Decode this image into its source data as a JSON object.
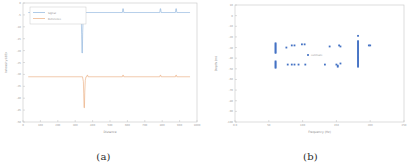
{
  "figure": {
    "panels": [
      {
        "id": "panel-a",
        "caption": "(a)",
        "chart_data": {
          "type": "line",
          "title": "",
          "xlabel": "Distance",
          "ylabel": "Intensity (dB)",
          "xlim": [
            0,
            1000
          ],
          "ylim": [
            -50,
            0
          ],
          "xticks": [
            0,
            100,
            200,
            300,
            400,
            500,
            600,
            700,
            800,
            900,
            1000
          ],
          "xticklabels": [
            "0",
            "100",
            "200",
            "300",
            "400",
            "500",
            "600",
            "700",
            "800",
            "900",
            "1000"
          ],
          "yticks": [
            -50,
            -45,
            -40,
            -35,
            -30,
            -25,
            -20,
            -15,
            -10,
            -5,
            0
          ],
          "yticklabels": [
            "-50",
            "-45",
            "-40",
            "-35",
            "-30",
            "-25",
            "-20",
            "-15",
            "-10",
            "-5",
            "0"
          ],
          "grid": false,
          "legend_position": "upper left",
          "series": [
            {
              "name": "Signal",
              "color": "#7ba7d7",
              "baseline": -4.0,
              "notch_x": 340,
              "notch_depth": -21.0,
              "spike_x": [
                575,
                790,
                880
              ],
              "spike_height": 1.6
            },
            {
              "name": "Reference",
              "color": "#e8a06a",
              "baseline": -31.0,
              "notch_x": 352,
              "notch_depth": -44.0,
              "spike_x": [
                370,
                575,
                790,
                880
              ],
              "spike_height": 0.7
            }
          ]
        }
      },
      {
        "id": "panel-b",
        "caption": "(b)",
        "chart_data": {
          "type": "scatter",
          "title": "",
          "xlabel": "Frequency (Hz)",
          "ylabel": "Depth (m)",
          "xlim": [
            0,
            250
          ],
          "ylim": [
            -100,
            10
          ],
          "xticks": [
            0,
            50,
            100,
            150,
            200,
            250
          ],
          "xticklabels": [
            "0.0",
            "50",
            "100",
            "150",
            "200",
            "250"
          ],
          "yticks": [
            -100,
            -90,
            -80,
            -70,
            -60,
            -50,
            -40,
            -30,
            -20,
            -10,
            0,
            10
          ],
          "yticklabels": [
            "-100",
            "-90",
            "-80",
            "-70",
            "-60",
            "-50",
            "-40",
            "-30",
            "-20",
            "-10",
            "0",
            "10"
          ],
          "grid": false,
          "marker": "square",
          "marker_color": "#4472c4",
          "annotation": "estimate",
          "annotation_x": 108,
          "annotation_y": -37,
          "series": [
            {
              "name": "estimate",
              "color": "#4472c4",
              "points": [
                [
                  60,
                  -26
                ],
                [
                  60,
                  -27
                ],
                [
                  60,
                  -28
                ],
                [
                  60,
                  -29
                ],
                [
                  60,
                  -30
                ],
                [
                  60,
                  -31
                ],
                [
                  60,
                  -32
                ],
                [
                  60,
                  -33
                ],
                [
                  60,
                  -34
                ],
                [
                  60,
                  -35
                ],
                [
                  60,
                  -43
                ],
                [
                  60,
                  -44
                ],
                [
                  60,
                  -45
                ],
                [
                  60,
                  -46
                ],
                [
                  60,
                  -47
                ],
                [
                  60,
                  -48
                ],
                [
                  60,
                  -49
                ],
                [
                  76,
                  -30
                ],
                [
                  84,
                  -28
                ],
                [
                  88,
                  -28
                ],
                [
                  99,
                  -27
                ],
                [
                  103,
                  -27
                ],
                [
                  78,
                  -46
                ],
                [
                  84,
                  -46
                ],
                [
                  88,
                  -46
                ],
                [
                  94,
                  -46
                ],
                [
                  104,
                  -46
                ],
                [
                  140,
                  -29
                ],
                [
                  154,
                  -28
                ],
                [
                  156,
                  -29
                ],
                [
                  133,
                  -46
                ],
                [
                  150,
                  -46
                ],
                [
                  152,
                  -47
                ],
                [
                  152,
                  -48
                ],
                [
                  156,
                  -45
                ],
                [
                  182,
                  -19
                ],
                [
                  182,
                  -24
                ],
                [
                  182,
                  -25
                ],
                [
                  182,
                  -26
                ],
                [
                  182,
                  -27
                ],
                [
                  182,
                  -28
                ],
                [
                  182,
                  -29
                ],
                [
                  182,
                  -30
                ],
                [
                  182,
                  -31
                ],
                [
                  182,
                  -32
                ],
                [
                  182,
                  -33
                ],
                [
                  182,
                  -34
                ],
                [
                  182,
                  -35
                ],
                [
                  182,
                  -36
                ],
                [
                  182,
                  -37
                ],
                [
                  182,
                  -38
                ],
                [
                  182,
                  -39
                ],
                [
                  182,
                  -40
                ],
                [
                  182,
                  -41
                ],
                [
                  182,
                  -42
                ],
                [
                  182,
                  -43
                ],
                [
                  182,
                  -44
                ],
                [
                  182,
                  -45
                ],
                [
                  182,
                  -46
                ],
                [
                  182,
                  -47
                ],
                [
                  182,
                  -48
                ],
                [
                  198,
                  -28
                ],
                [
                  200,
                  -28
                ]
              ]
            }
          ]
        }
      }
    ]
  }
}
